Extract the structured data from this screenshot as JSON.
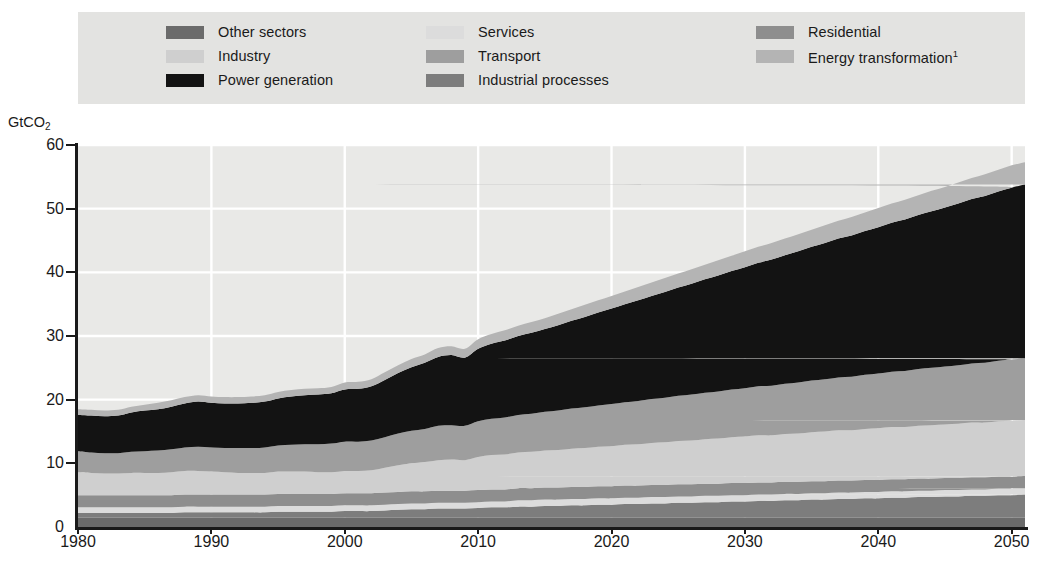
{
  "legend": {
    "columns": [
      [
        {
          "label": "Other sectors",
          "color": "#6b6b6b",
          "icon": "legend-swatch"
        },
        {
          "label": "Industry",
          "color": "#cfcfcf",
          "icon": "legend-swatch"
        },
        {
          "label": "Power generation",
          "color": "#131313",
          "icon": "legend-swatch"
        }
      ],
      [
        {
          "label": "Services",
          "color": "#dcdcdc",
          "icon": "legend-swatch"
        },
        {
          "label": "Transport",
          "color": "#9e9e9e",
          "icon": "legend-swatch"
        },
        {
          "label": "Industrial processes",
          "color": "#7d7d7d",
          "icon": "legend-swatch"
        }
      ],
      [
        {
          "label": "Residential",
          "color": "#8e8e8e",
          "icon": "legend-swatch"
        },
        {
          "label": "Energy transformation",
          "label_sup": "1",
          "color": "#b4b4b4",
          "icon": "legend-swatch"
        }
      ]
    ]
  },
  "axes": {
    "y_title": "GtCO",
    "y_title_sub": "2",
    "y_ticks": [
      "60",
      "50",
      "40",
      "30",
      "20",
      "10",
      "0"
    ],
    "x_ticks": [
      "1980",
      "1990",
      "2000",
      "2010",
      "2020",
      "2030",
      "2040",
      "2050"
    ]
  },
  "chart_data": {
    "type": "area",
    "stacked": true,
    "title": "",
    "xlabel": "",
    "ylabel": "GtCO2",
    "xlim": [
      1980,
      2051
    ],
    "ylim": [
      0,
      60
    ],
    "grid": true,
    "legend_position": "top",
    "x": [
      1980,
      1981,
      1982,
      1983,
      1984,
      1985,
      1986,
      1987,
      1988,
      1989,
      1990,
      1991,
      1992,
      1993,
      1994,
      1995,
      1996,
      1997,
      1998,
      1999,
      2000,
      2001,
      2002,
      2003,
      2004,
      2005,
      2006,
      2007,
      2008,
      2009,
      2010,
      2011,
      2012,
      2013,
      2014,
      2015,
      2016,
      2017,
      2018,
      2019,
      2020,
      2021,
      2022,
      2023,
      2024,
      2025,
      2026,
      2027,
      2028,
      2029,
      2030,
      2031,
      2032,
      2033,
      2034,
      2035,
      2036,
      2037,
      2038,
      2039,
      2040,
      2041,
      2042,
      2043,
      2044,
      2045,
      2046,
      2047,
      2048,
      2049,
      2050,
      2051
    ],
    "x_tick_values": [
      1980,
      1990,
      2000,
      2010,
      2020,
      2030,
      2040,
      2050
    ],
    "series": [
      {
        "name": "Other sectors",
        "color": "#6b6b6b",
        "values": [
          1.5,
          1.5,
          1.5,
          1.5,
          1.5,
          1.5,
          1.5,
          1.5,
          1.5,
          1.5,
          1.5,
          1.5,
          1.5,
          1.5,
          1.5,
          1.5,
          1.5,
          1.5,
          1.5,
          1.5,
          1.5,
          1.5,
          1.5,
          1.5,
          1.5,
          1.5,
          1.5,
          1.5,
          1.5,
          1.5,
          1.5,
          1.5,
          1.5,
          1.5,
          1.5,
          1.5,
          1.5,
          1.5,
          1.5,
          1.5,
          1.5,
          1.5,
          1.5,
          1.5,
          1.5,
          1.5,
          1.5,
          1.5,
          1.5,
          1.5,
          1.5,
          1.5,
          1.5,
          1.5,
          1.5,
          1.5,
          1.5,
          1.5,
          1.5,
          1.5,
          1.5,
          1.5,
          1.5,
          1.5,
          1.5,
          1.5,
          1.5,
          1.5,
          1.5,
          1.5,
          1.5,
          1.5
        ]
      },
      {
        "name": "Industrial processes",
        "color": "#7d7d7d",
        "values": [
          0.7,
          0.7,
          0.7,
          0.7,
          0.7,
          0.7,
          0.7,
          0.7,
          0.8,
          0.8,
          0.8,
          0.8,
          0.8,
          0.8,
          0.8,
          0.9,
          0.9,
          0.9,
          0.9,
          0.9,
          1.0,
          1.0,
          1.0,
          1.1,
          1.2,
          1.3,
          1.3,
          1.4,
          1.4,
          1.4,
          1.5,
          1.6,
          1.6,
          1.7,
          1.7,
          1.8,
          1.8,
          1.9,
          1.9,
          2.0,
          2.0,
          2.1,
          2.1,
          2.2,
          2.2,
          2.3,
          2.3,
          2.4,
          2.4,
          2.5,
          2.5,
          2.6,
          2.6,
          2.7,
          2.7,
          2.8,
          2.8,
          2.9,
          2.9,
          3.0,
          3.0,
          3.1,
          3.1,
          3.2,
          3.2,
          3.3,
          3.3,
          3.4,
          3.4,
          3.5,
          3.5,
          3.6
        ]
      },
      {
        "name": "Services",
        "color": "#dcdcdc",
        "values": [
          0.9,
          0.9,
          0.9,
          0.9,
          0.9,
          0.9,
          0.9,
          0.9,
          0.9,
          0.9,
          0.9,
          0.9,
          0.9,
          0.9,
          0.9,
          0.9,
          0.9,
          0.9,
          0.9,
          0.9,
          0.9,
          0.9,
          0.9,
          0.9,
          0.9,
          0.9,
          0.9,
          0.9,
          0.9,
          0.9,
          0.9,
          0.9,
          0.9,
          1.0,
          1.0,
          1.0,
          1.0,
          1.0,
          1.0,
          1.0,
          1.0,
          1.0,
          1.0,
          1.0,
          1.0,
          1.0,
          1.0,
          1.0,
          1.0,
          1.0,
          1.0,
          1.0,
          1.0,
          1.0,
          1.0,
          1.0,
          1.0,
          1.0,
          1.0,
          1.0,
          1.0,
          1.0,
          1.0,
          1.0,
          1.0,
          1.0,
          1.0,
          1.0,
          1.0,
          1.0,
          1.0,
          1.0
        ]
      },
      {
        "name": "Residential",
        "color": "#8e8e8e",
        "values": [
          1.9,
          1.9,
          1.9,
          1.9,
          1.9,
          1.9,
          1.9,
          1.9,
          1.9,
          1.9,
          1.9,
          1.9,
          1.9,
          1.9,
          1.9,
          1.9,
          1.9,
          1.9,
          1.9,
          1.9,
          1.9,
          1.9,
          1.9,
          1.9,
          1.9,
          1.9,
          1.9,
          1.9,
          1.9,
          1.9,
          1.9,
          1.9,
          1.9,
          1.9,
          1.9,
          1.9,
          1.9,
          1.9,
          1.9,
          1.9,
          1.9,
          1.9,
          1.9,
          1.9,
          1.9,
          1.9,
          1.9,
          1.9,
          1.9,
          1.9,
          1.9,
          1.9,
          1.9,
          1.9,
          1.9,
          1.9,
          1.9,
          1.9,
          1.9,
          1.9,
          1.9,
          1.9,
          1.9,
          1.9,
          1.9,
          1.9,
          1.9,
          1.9,
          1.9,
          1.9,
          1.9,
          1.9
        ]
      },
      {
        "name": "Industry",
        "color": "#cfcfcf",
        "values": [
          3.6,
          3.5,
          3.4,
          3.4,
          3.5,
          3.5,
          3.5,
          3.6,
          3.7,
          3.7,
          3.6,
          3.5,
          3.4,
          3.4,
          3.4,
          3.5,
          3.5,
          3.5,
          3.4,
          3.4,
          3.5,
          3.5,
          3.6,
          3.9,
          4.2,
          4.4,
          4.6,
          4.8,
          4.9,
          4.8,
          5.2,
          5.4,
          5.5,
          5.6,
          5.7,
          5.8,
          5.9,
          6.0,
          6.1,
          6.2,
          6.3,
          6.4,
          6.5,
          6.6,
          6.7,
          6.8,
          6.9,
          7.0,
          7.1,
          7.2,
          7.3,
          7.4,
          7.4,
          7.5,
          7.6,
          7.7,
          7.8,
          7.9,
          7.9,
          8.0,
          8.1,
          8.2,
          8.2,
          8.3,
          8.4,
          8.4,
          8.5,
          8.6,
          8.6,
          8.7,
          8.8,
          8.8
        ]
      },
      {
        "name": "Transport",
        "color": "#9e9e9e",
        "values": [
          3.3,
          3.2,
          3.2,
          3.2,
          3.3,
          3.4,
          3.5,
          3.6,
          3.7,
          3.8,
          3.8,
          3.8,
          3.9,
          3.9,
          4.0,
          4.1,
          4.2,
          4.3,
          4.4,
          4.5,
          4.6,
          4.6,
          4.7,
          4.8,
          5.0,
          5.1,
          5.2,
          5.4,
          5.4,
          5.4,
          5.6,
          5.7,
          5.8,
          5.9,
          6.0,
          6.1,
          6.2,
          6.3,
          6.4,
          6.5,
          6.6,
          6.7,
          6.8,
          6.9,
          7.0,
          7.1,
          7.2,
          7.3,
          7.4,
          7.5,
          7.6,
          7.7,
          7.8,
          7.9,
          8.0,
          8.1,
          8.2,
          8.3,
          8.4,
          8.5,
          8.6,
          8.7,
          8.8,
          8.9,
          9.0,
          9.1,
          9.2,
          9.3,
          9.4,
          9.5,
          9.6,
          9.7
        ]
      },
      {
        "name": "Power generation",
        "color": "#131313",
        "values": [
          5.7,
          5.8,
          5.8,
          5.9,
          6.2,
          6.4,
          6.5,
          6.7,
          6.9,
          7.1,
          7.0,
          7.0,
          7.0,
          7.1,
          7.2,
          7.4,
          7.6,
          7.7,
          7.8,
          7.9,
          8.2,
          8.3,
          8.5,
          9.0,
          9.5,
          10.0,
          10.4,
          10.8,
          11.0,
          10.7,
          11.4,
          11.8,
          12.1,
          12.4,
          12.7,
          13.0,
          13.4,
          13.8,
          14.2,
          14.6,
          15.0,
          15.4,
          15.8,
          16.2,
          16.6,
          17.0,
          17.4,
          17.8,
          18.2,
          18.6,
          19.0,
          19.4,
          19.8,
          20.2,
          20.6,
          21.0,
          21.4,
          21.8,
          22.2,
          22.6,
          23.0,
          23.4,
          23.8,
          24.2,
          24.6,
          25.0,
          25.4,
          25.8,
          26.2,
          26.6,
          27.0,
          27.3
        ]
      },
      {
        "name": "Energy transformation",
        "color": "#b4b4b4",
        "values": [
          0.9,
          0.9,
          0.9,
          0.9,
          0.9,
          0.9,
          1.0,
          1.0,
          1.0,
          1.0,
          1.0,
          1.0,
          1.0,
          1.0,
          1.0,
          1.0,
          1.0,
          1.0,
          1.0,
          1.0,
          1.1,
          1.1,
          1.1,
          1.2,
          1.2,
          1.3,
          1.3,
          1.4,
          1.4,
          1.4,
          1.5,
          1.5,
          1.6,
          1.6,
          1.7,
          1.7,
          1.8,
          1.8,
          1.9,
          1.9,
          2.0,
          2.0,
          2.1,
          2.1,
          2.2,
          2.2,
          2.3,
          2.3,
          2.4,
          2.4,
          2.5,
          2.5,
          2.6,
          2.6,
          2.7,
          2.7,
          2.8,
          2.8,
          2.9,
          2.9,
          3.0,
          3.0,
          3.1,
          3.1,
          3.2,
          3.2,
          3.3,
          3.3,
          3.4,
          3.4,
          3.5,
          3.5
        ]
      }
    ],
    "totals": [
      18.5,
      18.4,
      18.3,
      18.4,
      19.1,
      19.6,
      19.9,
      20.4,
      21.3,
      21.7,
      21.5,
      21.4,
      21.4,
      21.5,
      21.7,
      22.2,
      22.5,
      22.8,
      22.8,
      23.0,
      23.7,
      23.9,
      24.3,
      25.3,
      26.4,
      27.4,
      28.1,
      29.1,
      29.4,
      28.9,
      30.5,
      31.3,
      31.9,
      32.5,
      33.1,
      33.8,
      34.5,
      35.2,
      35.9,
      36.6,
      37.3,
      38.0,
      38.7,
      39.4,
      40.1,
      40.8,
      41.4,
      42.2,
      42.9,
      43.6,
      44.3,
      45.0,
      45.6,
      46.3,
      47.1,
      47.8,
      48.5,
      49.2,
      49.8,
      50.5,
      51.2,
      51.9,
      52.5,
      53.2,
      53.9,
      54.5,
      55.2,
      55.9,
      56.5,
      57.2,
      57.9,
      58.4
    ]
  }
}
